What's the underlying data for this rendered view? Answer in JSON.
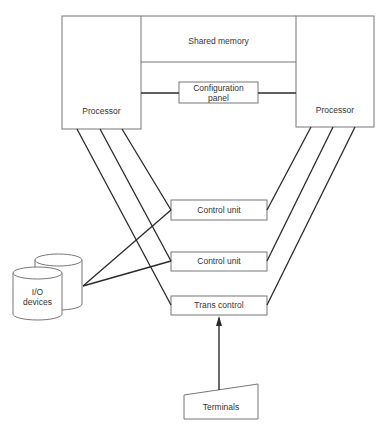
{
  "diagram": {
    "title": "",
    "nodes": {
      "processor_left": {
        "label": "Processor"
      },
      "processor_right": {
        "label": "Processor"
      },
      "shared_memory": {
        "label": "Shared memory"
      },
      "config_panel": {
        "line1": "Configuration",
        "line2": "panel"
      },
      "control_unit_1": {
        "label": "Control unit"
      },
      "control_unit_2": {
        "label": "Control unit"
      },
      "trans_control": {
        "label": "Trans control"
      },
      "io_devices": {
        "line1": "I/O",
        "line2": "devices"
      },
      "terminals": {
        "label": "Terminals"
      }
    },
    "edges": [
      {
        "from": "processor_left",
        "to": "control_unit_1"
      },
      {
        "from": "processor_left",
        "to": "control_unit_2"
      },
      {
        "from": "processor_left",
        "to": "trans_control"
      },
      {
        "from": "processor_right",
        "to": "control_unit_1"
      },
      {
        "from": "processor_right",
        "to": "control_unit_2"
      },
      {
        "from": "processor_right",
        "to": "trans_control"
      },
      {
        "from": "io_devices",
        "to": "control_unit_1"
      },
      {
        "from": "io_devices",
        "to": "control_unit_2"
      },
      {
        "from": "processor_left",
        "to": "config_panel"
      },
      {
        "from": "config_panel",
        "to": "processor_right"
      },
      {
        "from": "terminals",
        "to": "trans_control",
        "arrow": true
      }
    ],
    "colors": {
      "stroke": "#2a2a2a",
      "box": "#777777",
      "background": "#ffffff"
    }
  }
}
